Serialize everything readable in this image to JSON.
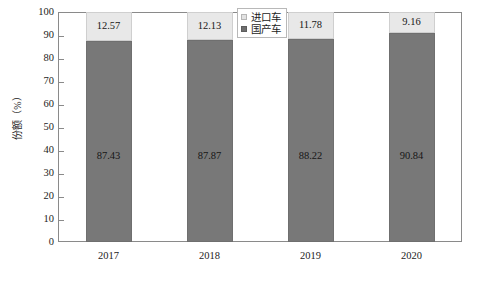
{
  "chart_data": {
    "type": "bar",
    "subtype": "stacked-percentage",
    "title": "",
    "xlabel": "",
    "ylabel": "份额（%）",
    "ylim": [
      0,
      100
    ],
    "ytick_step": 10,
    "yticks": [
      100,
      90,
      80,
      70,
      60,
      50,
      40,
      30,
      20,
      10,
      0
    ],
    "categories": [
      "2017",
      "2018",
      "2019",
      "2020"
    ],
    "grid": false,
    "legend_position": "top-center",
    "series": [
      {
        "name": "国产车",
        "color": "#787878",
        "stack_order": 0,
        "values": [
          87.43,
          87.87,
          88.22,
          90.84
        ],
        "labels": [
          "87.43",
          "87.87",
          "88.22",
          "90.84"
        ]
      },
      {
        "name": "进口车",
        "color": "#e8e8e8",
        "stack_order": 1,
        "values": [
          12.57,
          12.13,
          11.78,
          9.16
        ],
        "labels": [
          "12.57",
          "12.13",
          "11.78",
          "9.16"
        ]
      }
    ]
  },
  "legend": {
    "items": [
      {
        "label": "进口车",
        "swatch": "light"
      },
      {
        "label": "国产车",
        "swatch": "dark"
      }
    ]
  },
  "axis": {
    "y_title": "份额（%）",
    "y_ticklabels": [
      "100",
      "90",
      "80",
      "70",
      "60",
      "50",
      "40",
      "30",
      "20",
      "10",
      "0"
    ],
    "x_ticklabels": [
      "2017",
      "2018",
      "2019",
      "2020"
    ]
  },
  "colors": {
    "domestic": "#787878",
    "imported": "#e8e8e8",
    "frame": "#8a8a8a",
    "text": "#1c1c1c",
    "background": "#ffffff"
  }
}
